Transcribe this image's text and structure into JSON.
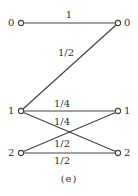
{
  "figure": {
    "caption": "(e)",
    "left_nodes": [
      {
        "id": "L0",
        "label": "0",
        "x": 21,
        "y": 23
      },
      {
        "id": "L1",
        "label": "1",
        "x": 21,
        "y": 111
      },
      {
        "id": "L2",
        "label": "2",
        "x": 21,
        "y": 153
      }
    ],
    "right_nodes": [
      {
        "id": "R0",
        "label": "0",
        "x": 118,
        "y": 23
      },
      {
        "id": "R1",
        "label": "1",
        "x": 118,
        "y": 111
      },
      {
        "id": "R2",
        "label": "2",
        "x": 118,
        "y": 153
      }
    ],
    "edges": [
      {
        "from": "L0",
        "to": "R0",
        "label": "1"
      },
      {
        "from": "L1",
        "to": "R0",
        "label": "1/2"
      },
      {
        "from": "L1",
        "to": "R1",
        "label": "1/4"
      },
      {
        "from": "L1",
        "to": "R2",
        "label": "1/4"
      },
      {
        "from": "L2",
        "to": "R1",
        "label": "1/2"
      },
      {
        "from": "L2",
        "to": "R2",
        "label": "1/2"
      }
    ]
  }
}
